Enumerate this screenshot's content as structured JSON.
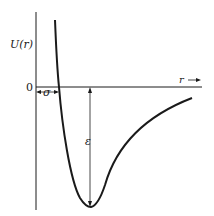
{
  "diagram": {
    "y_axis_label": "U(r)",
    "x_axis_label": "r →",
    "origin_label": "0",
    "sigma_label": "σ",
    "epsilon_label": "ε",
    "colors": {
      "line": "#1a1a1a",
      "background": "#ffffff"
    }
  }
}
